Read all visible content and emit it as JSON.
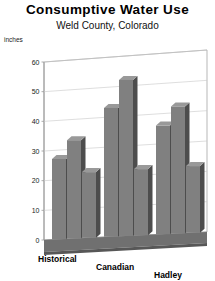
{
  "chart_data": {
    "type": "bar",
    "title": "Consumptive Water Use",
    "subtitle": "Weld County, Colorado",
    "xlabel": "",
    "ylabel": "inches",
    "ylim": [
      0,
      60
    ],
    "yticks": [
      0,
      10,
      20,
      30,
      40,
      50,
      60
    ],
    "grid": true,
    "legend": "none",
    "three_d": true,
    "categories": [
      "Historical",
      "Canadian",
      "Hadley"
    ],
    "series": [
      {
        "name": "Series 1",
        "values": [
          27,
          43,
          36
        ]
      },
      {
        "name": "Series 2",
        "values": [
          33,
          52,
          42
        ]
      },
      {
        "name": "Series 3",
        "values": [
          22,
          22,
          22
        ]
      }
    ]
  },
  "colors": {
    "bar_front": "#808080",
    "bar_side": "#4d4d4d",
    "bar_top": "#999999",
    "floor": "#707070",
    "floor_side": "#575757",
    "grid": "#c8c8c8",
    "axis": "#9a9a9a",
    "text": "#000000"
  }
}
